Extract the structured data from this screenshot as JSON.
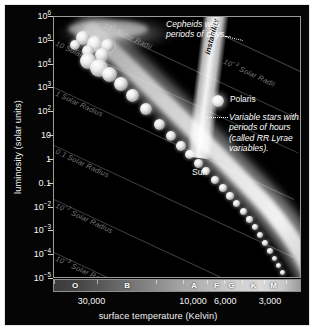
{
  "figure": {
    "background_color": "#050505",
    "plot_background_color": "#000000",
    "frame_color": "#9a9a9a"
  },
  "axes": {
    "ylabel": "luminosity (solar units)",
    "xlabel": "surface temperature (Kelvin)",
    "yticks": [
      {
        "label": "10",
        "exp": "6",
        "pos": 0.0
      },
      {
        "label": "10",
        "exp": "5",
        "pos": 0.0909
      },
      {
        "label": "10",
        "exp": "4",
        "pos": 0.1818
      },
      {
        "label": "10",
        "exp": "3",
        "pos": 0.2727
      },
      {
        "label": "10",
        "exp": "2",
        "pos": 0.3636
      },
      {
        "label": "10",
        "exp": "",
        "pos": 0.4545
      },
      {
        "label": "1",
        "exp": "",
        "pos": 0.5455
      },
      {
        "label": "0.1",
        "exp": "",
        "pos": 0.6364
      },
      {
        "label": "10",
        "exp": "−2",
        "pos": 0.7273
      },
      {
        "label": "10",
        "exp": "−3",
        "pos": 0.8182
      },
      {
        "label": "10",
        "exp": "−4",
        "pos": 0.9091
      },
      {
        "label": "10",
        "exp": "−5",
        "pos": 1.0
      }
    ],
    "xticks": [
      {
        "label": "30,000",
        "pos": 0.155
      },
      {
        "label": "10,000",
        "pos": 0.565
      },
      {
        "label": "6,000",
        "pos": 0.695
      },
      {
        "label": "3,000",
        "pos": 0.875
      }
    ]
  },
  "spectral_classes": {
    "classes": [
      {
        "letter": "O",
        "pos": 0.085
      },
      {
        "letter": "B",
        "pos": 0.295
      },
      {
        "letter": "A",
        "pos": 0.565
      },
      {
        "letter": "F",
        "pos": 0.655
      },
      {
        "letter": "G",
        "pos": 0.715
      },
      {
        "letter": "K",
        "pos": 0.805
      },
      {
        "letter": "M",
        "pos": 0.885
      }
    ],
    "tick_positions": [
      0.0,
      0.175,
      0.41,
      0.52,
      0.615,
      0.685,
      0.76,
      0.845,
      0.935,
      1.0
    ]
  },
  "radius_lines": [
    {
      "id": "r1000",
      "label": "10",
      "exp": "3",
      "suffix": " Solar Radii",
      "left": 66,
      "top": 18,
      "angle": 25,
      "length": 230,
      "label_left": 52,
      "label_top": 4,
      "label_angle": 25
    },
    {
      "id": "r10",
      "label": "10",
      "exp": "",
      "suffix": " Solar Radii",
      "left": 18,
      "top": 30,
      "angle": 25,
      "length": 250,
      "label_left": 4,
      "label_top": 22,
      "label_angle": 25
    },
    {
      "id": "r1",
      "label": "1",
      "exp": "",
      "suffix": " Solar Radius",
      "left": 0,
      "top": 70,
      "angle": 25,
      "length": 265,
      "label_left": 4,
      "label_top": 72,
      "label_angle": 25
    },
    {
      "id": "r0p1",
      "label": "0.1",
      "exp": "",
      "suffix": " Solar Radius",
      "left": 0,
      "top": 128,
      "angle": 25,
      "length": 265,
      "label_left": 4,
      "label_top": 130,
      "label_angle": 25
    },
    {
      "id": "r0p01",
      "label": "10",
      "exp": "−2",
      "suffix": " Solar Radius",
      "left": 0,
      "top": 182,
      "angle": 25,
      "length": 265,
      "label_left": 4,
      "label_top": 184,
      "label_angle": 25
    },
    {
      "id": "r0p001",
      "label": "10",
      "exp": "−3",
      "suffix": " Solar Radius",
      "left": 0,
      "top": 235,
      "angle": 25,
      "length": 265,
      "label_left": 4,
      "label_top": 237,
      "label_angle": 25
    },
    {
      "id": "r0p001b",
      "label": "10",
      "exp": "−3",
      "suffix": " Solar Radii",
      "left": 152,
      "top": 10,
      "angle": 25,
      "length": 120,
      "label_left": 172,
      "label_top": 40,
      "label_angle": 25
    }
  ],
  "annotations": {
    "cepheids": "Cepheids with\nperiods of days...",
    "instability_strip": "instability strip",
    "polaris": "Polaris",
    "variable_stars": "Variable stars with\nperiods of hours\n(called RR Lyrae\nvariables).",
    "sun": "Sun"
  },
  "chart_data": {
    "type": "scatter",
    "xlabel": "surface temperature (Kelvin)",
    "ylabel": "luminosity (solar units)",
    "xscale": "log-reversed",
    "yscale": "log",
    "xlim": [
      40000,
      2500
    ],
    "ylim": [
      1e-05,
      1000000.0
    ],
    "grid": false,
    "legend": "none",
    "xtick_labels": [
      "30,000",
      "10,000",
      "6,000",
      "3,000"
    ],
    "ytick_labels": [
      "10^6",
      "10^5",
      "10^4",
      "10^3",
      "10^2",
      "10",
      "1",
      "0.1",
      "10^-2",
      "10^-3",
      "10^-4",
      "10^-5"
    ],
    "spectral_class_axis": [
      "O",
      "B",
      "A",
      "F",
      "G",
      "K",
      "M"
    ],
    "iso_radius_lines": [
      "10^3 Solar Radii",
      "10 Solar Radii",
      "1 Solar Radius",
      "0.1 Solar Radius",
      "10^-2 Solar Radius",
      "10^-3 Solar Radius"
    ],
    "annotations": [
      "Cepheids with periods of days...",
      "instability strip",
      "Polaris",
      "Variable stars with periods of hours (called RR Lyrae variables).",
      "Sun"
    ],
    "bands": [
      {
        "name": "main sequence",
        "description": "broad luminous band running from upper-left (hot, luminous) to lower-right (cool, dim)"
      },
      {
        "name": "supergiants",
        "description": "horizontal clump of large stars at top-left near 10^5-10^6 solar luminosity"
      },
      {
        "name": "instability strip",
        "description": "near-vertical strip crossing the diagram around A-F spectral classes"
      }
    ],
    "stars": [
      {
        "label": "Sun",
        "temperature": 5800,
        "luminosity": 1
      },
      {
        "label": "Polaris",
        "temperature": 6000,
        "luminosity": 2000
      }
    ]
  }
}
